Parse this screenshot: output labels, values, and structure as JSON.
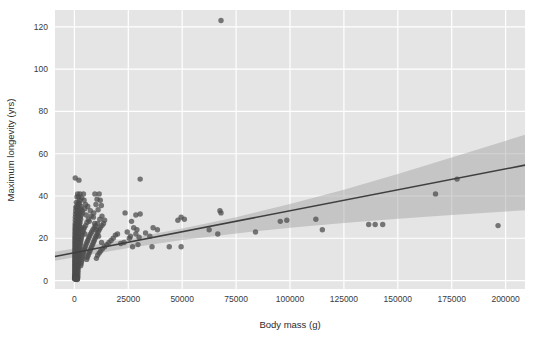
{
  "chart_data": {
    "type": "scatter",
    "title": "",
    "xlabel": "Body mass (g)",
    "ylabel": "Maximum longevity (yrs)",
    "xlim": [
      -9000,
      209000
    ],
    "ylim": [
      -4,
      128
    ],
    "xticks": [
      0,
      25000,
      50000,
      75000,
      100000,
      125000,
      150000,
      175000,
      200000
    ],
    "xtick_labels": [
      "0",
      "25000",
      "50000",
      "75000",
      "100000",
      "125000",
      "150000",
      "175000",
      "200000"
    ],
    "yticks": [
      0,
      20,
      40,
      60,
      80,
      100,
      120
    ],
    "ytick_labels": [
      "0",
      "20",
      "40",
      "60",
      "80",
      "100",
      "120"
    ],
    "grid": true,
    "grid_color": "#ffffff",
    "panel_color": "#e5e5e5",
    "figure_color": "#ffffff",
    "point_color": "#4d4d4d",
    "point_opacity": 0.75,
    "point_radius": 2.7,
    "line_color": "#3f3f3f",
    "line_width": 1.6,
    "band_color": "#9e9e9e",
    "band_opacity": 0.45,
    "legend": null,
    "regression": {
      "type": "linear",
      "intercept": 13.2,
      "slope": 0.000198,
      "x_start": -9000,
      "x_end": 209000,
      "y_start": 11.4,
      "y_end": 54.6,
      "ci_label": "95% confidence band",
      "ci_lower": [
        [
          -9000,
          9.4
        ],
        [
          0,
          11.0
        ],
        [
          25000,
          15.4
        ],
        [
          50000,
          19.2
        ],
        [
          75000,
          22.3
        ],
        [
          100000,
          25.0
        ],
        [
          125000,
          27.2
        ],
        [
          150000,
          29.2
        ],
        [
          175000,
          31.0
        ],
        [
          209000,
          33.3
        ]
      ],
      "ci_upper": [
        [
          -9000,
          13.6
        ],
        [
          0,
          15.2
        ],
        [
          25000,
          19.8
        ],
        [
          50000,
          24.6
        ],
        [
          75000,
          30.0
        ],
        [
          100000,
          36.2
        ],
        [
          125000,
          43.0
        ],
        [
          150000,
          50.4
        ],
        [
          175000,
          58.2
        ],
        [
          209000,
          69.0
        ]
      ]
    },
    "points": [
      [
        68000,
        123
      ],
      [
        400,
        48.5
      ],
      [
        2100,
        47.5
      ],
      [
        30500,
        48
      ],
      [
        1500,
        41
      ],
      [
        2600,
        41
      ],
      [
        4200,
        41
      ],
      [
        9500,
        41
      ],
      [
        11500,
        41
      ],
      [
        1200,
        39.5
      ],
      [
        2000,
        39.5
      ],
      [
        3400,
        39
      ],
      [
        10500,
        38.5
      ],
      [
        12000,
        38
      ],
      [
        900,
        37
      ],
      [
        1800,
        37
      ],
      [
        2400,
        36.5
      ],
      [
        5200,
        36
      ],
      [
        10000,
        36
      ],
      [
        12500,
        35.5
      ],
      [
        700,
        34.5
      ],
      [
        1600,
        34.5
      ],
      [
        2800,
        34
      ],
      [
        4800,
        34
      ],
      [
        11000,
        33.5
      ],
      [
        600,
        33
      ],
      [
        1400,
        33
      ],
      [
        2200,
        32.5
      ],
      [
        3800,
        32
      ],
      [
        9000,
        32
      ],
      [
        23500,
        32
      ],
      [
        67500,
        33
      ],
      [
        68000,
        32
      ],
      [
        500,
        31.5
      ],
      [
        1300,
        31.5
      ],
      [
        2000,
        31
      ],
      [
        3200,
        31
      ],
      [
        7800,
        30.5
      ],
      [
        12800,
        30.5
      ],
      [
        28500,
        31
      ],
      [
        30500,
        31.5
      ],
      [
        49500,
        30
      ],
      [
        51000,
        29
      ],
      [
        48000,
        28.5
      ],
      [
        450,
        30
      ],
      [
        1100,
        30
      ],
      [
        1900,
        29.5
      ],
      [
        2900,
        29
      ],
      [
        6500,
        29
      ],
      [
        11800,
        29
      ],
      [
        14000,
        28.5
      ],
      [
        26500,
        28
      ],
      [
        112000,
        29
      ],
      [
        400,
        28.5
      ],
      [
        1000,
        28
      ],
      [
        1700,
        28
      ],
      [
        2600,
        27.5
      ],
      [
        5800,
        27.5
      ],
      [
        10800,
        27
      ],
      [
        13500,
        27
      ],
      [
        95500,
        28
      ],
      [
        98500,
        28.5
      ],
      [
        380,
        27
      ],
      [
        950,
        27
      ],
      [
        1550,
        26.5
      ],
      [
        2400,
        26.5
      ],
      [
        5200,
        26
      ],
      [
        9800,
        26
      ],
      [
        12800,
        26
      ],
      [
        136500,
        26.5
      ],
      [
        139500,
        26.5
      ],
      [
        143000,
        26.5
      ],
      [
        196500,
        26
      ],
      [
        350,
        26
      ],
      [
        900,
        26
      ],
      [
        1500,
        25.5
      ],
      [
        2300,
        25.5
      ],
      [
        4600,
        25
      ],
      [
        9200,
        25
      ],
      [
        12000,
        25
      ],
      [
        27500,
        25
      ],
      [
        29000,
        24
      ],
      [
        36500,
        25
      ],
      [
        38500,
        24
      ],
      [
        330,
        25
      ],
      [
        850,
        25
      ],
      [
        1450,
        24.5
      ],
      [
        2200,
        24.5
      ],
      [
        4200,
        24
      ],
      [
        8600,
        24
      ],
      [
        11500,
        24
      ],
      [
        62500,
        24
      ],
      [
        66500,
        22
      ],
      [
        84000,
        23
      ],
      [
        310,
        24
      ],
      [
        800,
        24
      ],
      [
        1400,
        23.5
      ],
      [
        2100,
        23.5
      ],
      [
        3900,
        23
      ],
      [
        8000,
        23
      ],
      [
        11000,
        23
      ],
      [
        24500,
        23
      ],
      [
        28500,
        22
      ],
      [
        33000,
        22.5
      ],
      [
        115000,
        24
      ],
      [
        300,
        23
      ],
      [
        760,
        23
      ],
      [
        1350,
        22.5
      ],
      [
        2000,
        22.5
      ],
      [
        3600,
        22
      ],
      [
        7500,
        22
      ],
      [
        10500,
        22
      ],
      [
        20000,
        22
      ],
      [
        167500,
        41
      ],
      [
        177500,
        48
      ],
      [
        280,
        22
      ],
      [
        720,
        22
      ],
      [
        1300,
        21.5
      ],
      [
        1950,
        21.5
      ],
      [
        3400,
        21
      ],
      [
        7000,
        21
      ],
      [
        10000,
        21
      ],
      [
        19000,
        21.5
      ],
      [
        26000,
        21
      ],
      [
        30000,
        20.5
      ],
      [
        265,
        21
      ],
      [
        690,
        21
      ],
      [
        1250,
        20.5
      ],
      [
        1900,
        20.5
      ],
      [
        3200,
        20
      ],
      [
        6600,
        20
      ],
      [
        9600,
        20
      ],
      [
        18000,
        20
      ],
      [
        25500,
        20
      ],
      [
        35000,
        21
      ],
      [
        250,
        20
      ],
      [
        660,
        20
      ],
      [
        1200,
        19.5
      ],
      [
        1850,
        19.5
      ],
      [
        3000,
        19
      ],
      [
        6200,
        19
      ],
      [
        9200,
        19
      ],
      [
        17000,
        19
      ],
      [
        23000,
        18
      ],
      [
        29500,
        17
      ],
      [
        240,
        19
      ],
      [
        630,
        19
      ],
      [
        1150,
        18.5
      ],
      [
        1800,
        18.5
      ],
      [
        2850,
        18
      ],
      [
        5800,
        18
      ],
      [
        8800,
        18
      ],
      [
        16000,
        18
      ],
      [
        21500,
        17.5
      ],
      [
        36000,
        16
      ],
      [
        230,
        18
      ],
      [
        600,
        18
      ],
      [
        1100,
        17.5
      ],
      [
        1750,
        17.5
      ],
      [
        2700,
        17
      ],
      [
        5400,
        17
      ],
      [
        8400,
        17
      ],
      [
        15000,
        17
      ],
      [
        44000,
        16
      ],
      [
        49500,
        16
      ],
      [
        220,
        17
      ],
      [
        580,
        17
      ],
      [
        1050,
        16.5
      ],
      [
        1700,
        16.5
      ],
      [
        2550,
        16
      ],
      [
        5000,
        16
      ],
      [
        8000,
        16
      ],
      [
        14000,
        16
      ],
      [
        27000,
        16
      ],
      [
        210,
        16
      ],
      [
        560,
        16
      ],
      [
        1000,
        15.5
      ],
      [
        1650,
        15.5
      ],
      [
        2400,
        15
      ],
      [
        4700,
        15
      ],
      [
        7600,
        15
      ],
      [
        13000,
        15
      ],
      [
        200,
        15
      ],
      [
        540,
        15
      ],
      [
        960,
        14.5
      ],
      [
        1600,
        14.5
      ],
      [
        2300,
        14
      ],
      [
        4400,
        14
      ],
      [
        7200,
        14
      ],
      [
        12200,
        14
      ],
      [
        195,
        14
      ],
      [
        520,
        14
      ],
      [
        920,
        13.5
      ],
      [
        1550,
        13.5
      ],
      [
        2200,
        13
      ],
      [
        4100,
        13
      ],
      [
        6800,
        13
      ],
      [
        11500,
        13
      ],
      [
        185,
        13
      ],
      [
        500,
        13
      ],
      [
        880,
        12.5
      ],
      [
        1500,
        12.5
      ],
      [
        2100,
        12
      ],
      [
        3900,
        12
      ],
      [
        6400,
        12
      ],
      [
        10800,
        12
      ],
      [
        180,
        12
      ],
      [
        480,
        12
      ],
      [
        850,
        11.5
      ],
      [
        1450,
        11.5
      ],
      [
        2000,
        11
      ],
      [
        3700,
        11
      ],
      [
        6000,
        11
      ],
      [
        10200,
        10.5
      ],
      [
        175,
        11
      ],
      [
        465,
        11
      ],
      [
        820,
        10.5
      ],
      [
        1400,
        10.5
      ],
      [
        1950,
        10
      ],
      [
        3500,
        10
      ],
      [
        5700,
        10
      ],
      [
        170,
        10
      ],
      [
        450,
        10
      ],
      [
        790,
        9.5
      ],
      [
        1350,
        9.5
      ],
      [
        1900,
        9
      ],
      [
        3300,
        9
      ],
      [
        160,
        9
      ],
      [
        435,
        9
      ],
      [
        760,
        8.5
      ],
      [
        1300,
        8.5
      ],
      [
        1850,
        8
      ],
      [
        3100,
        8
      ],
      [
        155,
        8
      ],
      [
        420,
        8
      ],
      [
        730,
        7.5
      ],
      [
        1250,
        7.5
      ],
      [
        1800,
        7
      ],
      [
        2900,
        7
      ],
      [
        150,
        7
      ],
      [
        405,
        7
      ],
      [
        700,
        6.5
      ],
      [
        1200,
        6.5
      ],
      [
        1750,
        6
      ],
      [
        145,
        6
      ],
      [
        390,
        6
      ],
      [
        670,
        5.5
      ],
      [
        1150,
        5.5
      ],
      [
        1700,
        5
      ],
      [
        140,
        5
      ],
      [
        375,
        5
      ],
      [
        640,
        4.5
      ],
      [
        1100,
        4.5
      ],
      [
        1650,
        4
      ],
      [
        135,
        4
      ],
      [
        360,
        4
      ],
      [
        610,
        3.5
      ],
      [
        1050,
        3.5
      ],
      [
        1600,
        3
      ],
      [
        130,
        3
      ],
      [
        345,
        3
      ],
      [
        580,
        2.5
      ],
      [
        1000,
        2.5
      ],
      [
        1550,
        2
      ],
      [
        125,
        2
      ],
      [
        330,
        2
      ],
      [
        550,
        1.8
      ],
      [
        960,
        1.8
      ],
      [
        1500,
        1.5
      ],
      [
        120,
        1.5
      ],
      [
        315,
        1.5
      ],
      [
        520,
        1.2
      ],
      [
        920,
        1.2
      ],
      [
        1450,
        1
      ],
      [
        115,
        1
      ],
      [
        300,
        1
      ],
      [
        500,
        0.9
      ],
      [
        880,
        0.9
      ],
      [
        1400,
        0.8
      ],
      [
        110,
        0.8
      ],
      [
        290,
        0.8
      ],
      [
        480,
        0.6
      ],
      [
        850,
        0.6
      ],
      [
        1350,
        0.5
      ],
      [
        2700,
        30
      ],
      [
        3100,
        35
      ],
      [
        4500,
        38
      ],
      [
        6200,
        35
      ],
      [
        7400,
        33
      ],
      [
        8800,
        30
      ],
      [
        9400,
        27
      ],
      [
        10200,
        24
      ],
      [
        11200,
        21
      ],
      [
        12600,
        18
      ],
      [
        1700,
        36
      ],
      [
        2500,
        38
      ],
      [
        3600,
        33
      ],
      [
        5500,
        31
      ],
      [
        6900,
        28
      ],
      [
        900,
        35
      ],
      [
        1300,
        32
      ],
      [
        2100,
        28
      ],
      [
        3300,
        25
      ],
      [
        4900,
        22
      ]
    ]
  }
}
